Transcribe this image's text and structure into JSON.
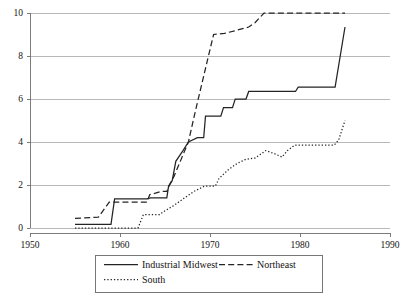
{
  "chart_data": {
    "type": "line",
    "title": "",
    "subtitle": "",
    "xlabel": "",
    "ylabel": "",
    "xlim": [
      1950,
      1990
    ],
    "ylim": [
      0,
      10
    ],
    "xticks": [
      1950,
      1960,
      1970,
      1980,
      1990
    ],
    "yticks": [
      0,
      2,
      4,
      6,
      8,
      10
    ],
    "xtick_labels": [
      "1950",
      "1960",
      "1970",
      "1980",
      "1990"
    ],
    "ytick_labels": [
      "0",
      "2",
      "4",
      "6",
      "8",
      "10"
    ],
    "grid": "horizontal",
    "legend_position": "below-center",
    "series": [
      {
        "name": "Industrial Midwest",
        "style": "solid",
        "color": "#242424",
        "points": [
          [
            1955.0,
            0.17
          ],
          [
            1959.0,
            0.17
          ],
          [
            1959.4,
            1.35
          ],
          [
            1963.0,
            1.35
          ],
          [
            1963.4,
            1.4
          ],
          [
            1965.2,
            1.4
          ],
          [
            1965.4,
            1.95
          ],
          [
            1965.8,
            2.2
          ],
          [
            1966.2,
            3.1
          ],
          [
            1967.0,
            3.6
          ],
          [
            1967.6,
            4.0
          ],
          [
            1968.6,
            4.2
          ],
          [
            1969.3,
            4.2
          ],
          [
            1969.5,
            5.2
          ],
          [
            1971.2,
            5.2
          ],
          [
            1971.5,
            5.6
          ],
          [
            1972.5,
            5.6
          ],
          [
            1972.8,
            6.0
          ],
          [
            1974.0,
            6.0
          ],
          [
            1974.3,
            6.35
          ],
          [
            1979.5,
            6.35
          ],
          [
            1979.8,
            6.55
          ],
          [
            1983.9,
            6.55
          ],
          [
            1985.0,
            9.35
          ]
        ]
      },
      {
        "name": "Northeast",
        "style": "dashed",
        "color": "#242424",
        "points": [
          [
            1955.0,
            0.45
          ],
          [
            1957.6,
            0.5
          ],
          [
            1958.8,
            1.2
          ],
          [
            1963.0,
            1.2
          ],
          [
            1963.3,
            1.55
          ],
          [
            1964.6,
            1.7
          ],
          [
            1965.2,
            1.7
          ],
          [
            1965.5,
            2.0
          ],
          [
            1966.0,
            2.4
          ],
          [
            1967.6,
            4.0
          ],
          [
            1968.3,
            5.3
          ],
          [
            1969.6,
            7.6
          ],
          [
            1970.4,
            9.0
          ],
          [
            1971.6,
            9.05
          ],
          [
            1973.0,
            9.2
          ],
          [
            1974.3,
            9.35
          ],
          [
            1975.0,
            9.55
          ],
          [
            1976.0,
            10.0
          ],
          [
            1985.0,
            10.0
          ]
        ]
      },
      {
        "name": "South",
        "style": "dotted",
        "color": "#242424",
        "points": [
          [
            1955.0,
            0.0
          ],
          [
            1962.0,
            0.0
          ],
          [
            1962.6,
            0.62
          ],
          [
            1964.4,
            0.62
          ],
          [
            1964.8,
            0.75
          ],
          [
            1966.0,
            1.05
          ],
          [
            1967.0,
            1.35
          ],
          [
            1968.2,
            1.7
          ],
          [
            1969.4,
            1.95
          ],
          [
            1970.6,
            1.95
          ],
          [
            1971.0,
            2.3
          ],
          [
            1972.0,
            2.7
          ],
          [
            1973.0,
            3.0
          ],
          [
            1974.0,
            3.2
          ],
          [
            1975.0,
            3.25
          ],
          [
            1976.2,
            3.6
          ],
          [
            1977.2,
            3.45
          ],
          [
            1978.0,
            3.3
          ],
          [
            1978.6,
            3.6
          ],
          [
            1979.4,
            3.85
          ],
          [
            1983.8,
            3.85
          ],
          [
            1984.3,
            4.1
          ],
          [
            1985.0,
            5.0
          ]
        ]
      }
    ],
    "legend_entries": [
      {
        "label": "Industrial Midwest",
        "style": "solid"
      },
      {
        "label": "Northeast",
        "style": "dashed"
      },
      {
        "label": "South",
        "style": "dotted"
      }
    ]
  }
}
